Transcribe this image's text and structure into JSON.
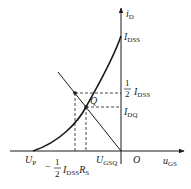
{
  "diagram": {
    "type": "jfet-transfer-characteristic",
    "axes": {
      "x_label": "u",
      "x_sub": "GS",
      "y_label": "i",
      "y_sub": "D",
      "origin_label": "O"
    },
    "y_ticks": {
      "idss": {
        "main": "I",
        "sub": "DSS"
      },
      "half_idss": {
        "num": "1",
        "den": "2",
        "main": "I",
        "sub": "DSS"
      },
      "idq": {
        "main": "I",
        "sub": "DQ"
      }
    },
    "x_ticks": {
      "up": {
        "main": "U",
        "sub": "P"
      },
      "ugsq": {
        "main": "U",
        "sub": "GSQ"
      },
      "minus_half_idss_rs": {
        "sign": "−",
        "num": "1",
        "den": "2",
        "main": "I",
        "sub": "DSS",
        "main2": "R",
        "sub2": "S"
      }
    },
    "points": {
      "q_label": "Q"
    },
    "colors": {
      "line": "#1a1a1a",
      "background": "#ffffff"
    }
  }
}
